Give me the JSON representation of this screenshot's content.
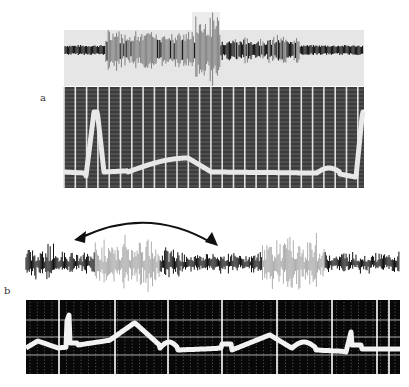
{
  "figure": {
    "panels": [
      {
        "label": "a",
        "top_trace": {
          "description": "oscillating signal trace with central high-amplitude burst",
          "background": "#e8e8e8",
          "trace_color": "#111111"
        },
        "bottom_trace": {
          "description": "grid-paper recording with sharp peak at left, broad hump in middle, rising edge at right",
          "grid_bg": "#3a3a3a",
          "grid_line": "#d8d8d8",
          "trace_color": "#e6e6e6"
        }
      },
      {
        "label": "b",
        "annotation": "double-headed curved arrow spanning the first burst",
        "top_trace": {
          "description": "noisy signal with two faded high-amplitude bursts",
          "trace_color": "#111111"
        },
        "bottom_trace": {
          "description": "grid recording with repeating ECG-like humps",
          "grid_bg": "#0a0a0a",
          "grid_line": "#eeeeee",
          "trace_color": "#f0f0f0"
        }
      }
    ]
  }
}
